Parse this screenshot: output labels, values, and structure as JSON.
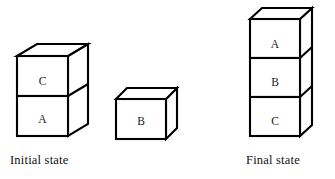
{
  "figure": {
    "background_color": "#ffffff",
    "line_color": "#000000",
    "face_color": "#ffffff"
  },
  "initial_state": {
    "caption": "Initial state",
    "stacks": [
      {
        "name": "left-stack",
        "blocks_bottom_to_top": [
          "A",
          "C"
        ],
        "labels": {
          "top": "C",
          "bottom": "A"
        }
      },
      {
        "name": "lone-block",
        "blocks_bottom_to_top": [
          "B"
        ],
        "labels": {
          "only": "B"
        }
      }
    ]
  },
  "final_state": {
    "caption": "Final state",
    "stacks": [
      {
        "name": "right-stack",
        "blocks_bottom_to_top": [
          "C",
          "B",
          "A"
        ],
        "labels": {
          "top": "A",
          "middle": "B",
          "bottom": "C"
        }
      }
    ]
  }
}
